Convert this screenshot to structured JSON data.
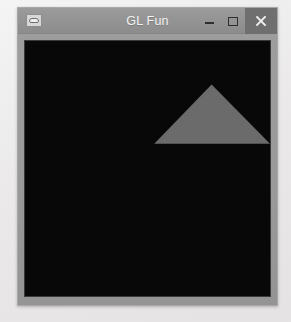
{
  "window": {
    "title": "GL Fun",
    "app_icon": "application-icon",
    "frame_color": "#9a9a9a",
    "titlebar_color": "#949494",
    "title_text_color": "#f4f4f4"
  },
  "caption_buttons": [
    {
      "name": "minimize-button",
      "icon": "minimize-icon",
      "label": "Minimize",
      "glyph": "–"
    },
    {
      "name": "maximize-button",
      "icon": "maximize-icon",
      "label": "Maximize",
      "glyph": "□"
    },
    {
      "name": "close-button",
      "icon": "close-icon",
      "label": "Close",
      "glyph": "×"
    }
  ],
  "canvas": {
    "name": "opengl-render-surface",
    "background_color": "#070707",
    "border_color": "#3a3a3a",
    "shape": {
      "name": "triangle",
      "fill_color": "#6b6b6b",
      "points": "179,44 124,104 235,104",
      "description": "gray isosceles triangle"
    }
  },
  "desktop": {
    "background_color": "#efeded"
  }
}
